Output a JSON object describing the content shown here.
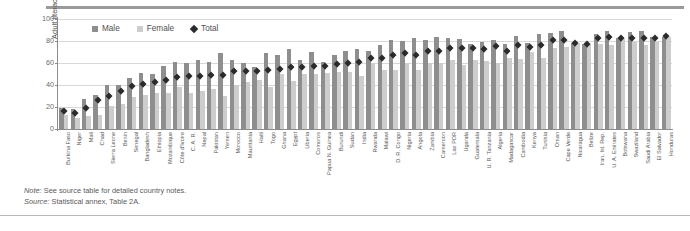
{
  "axis": {
    "ylabel": "Adult literacy rate (%)",
    "yticks": [
      "100",
      "80",
      "60",
      "40",
      "20",
      "0"
    ]
  },
  "legend": {
    "items": [
      {
        "label": "Male",
        "type": "swatch",
        "color": "#8e8e8e",
        "icon": "square-swatch"
      },
      {
        "label": "Female",
        "type": "swatch",
        "color": "#cdcdcd",
        "icon": "square-swatch"
      },
      {
        "label": "Total",
        "type": "diamond",
        "color": "#2b2b2b",
        "icon": "diamond-marker"
      }
    ]
  },
  "notes": {
    "note_key": "Note:",
    "note_text": " See source table for detailed country notes.",
    "source_key": "Source:",
    "source_text": " Statistical annex, Table 2A."
  },
  "chart_data": {
    "type": "bar",
    "title": "",
    "subtitle": "",
    "xlabel": "",
    "ylabel": "Adult literacy rate (%)",
    "ylim": [
      0,
      100
    ],
    "yticks": [
      0,
      20,
      40,
      60,
      80,
      100
    ],
    "grid": true,
    "legend_position": "top-center",
    "annotations": [
      "Note: See source table for detailed country notes.",
      "Source: Statistical annex, Table 2A."
    ],
    "marker_series": {
      "name": "Total",
      "marker": "diamond",
      "color": "#2b2b2b"
    },
    "categories": [
      "Burkina Faso",
      "Niger",
      "Mali",
      "Chad",
      "Sierra Leone",
      "Benin",
      "Senegal",
      "Bangladesh",
      "Ethiopia",
      "Mozambique",
      "Côte d'Ivoire",
      "C. A. R.",
      "Nepal",
      "Pakistan",
      "Yemen",
      "Morocco",
      "Mauritania",
      "Haiti",
      "Togo",
      "Ghana",
      "Egypt",
      "Liberia",
      "Comoros",
      "Papua N. Guinea",
      "Burundi",
      "Sudan",
      "India",
      "Rwanda",
      "Malawi",
      "D. R. Congo",
      "Nigeria",
      "Angola",
      "Zambia",
      "Cameroon",
      "Lao PDR",
      "Uganda",
      "Guatemala",
      "U. R. Tanzania",
      "Algeria",
      "Madagascar",
      "Cambodia",
      "Kenya",
      "Tunisia",
      "Oman",
      "Cape Verde",
      "Nicaragua",
      "Belize",
      "Iran, Isl. Rep.",
      "U. A. Emirates",
      "Botswana",
      "Swaziland",
      "Saudi Arabia",
      "El Salvador",
      "Honduras"
    ],
    "series": [
      {
        "name": "Male",
        "color": "#8e8e8e",
        "values": [
          19,
          18,
          27,
          31,
          40,
          40,
          46,
          51,
          50,
          57,
          61,
          60,
          63,
          61,
          69,
          63,
          60,
          56,
          69,
          67,
          73,
          63,
          70,
          61,
          67,
          71,
          73,
          71,
          76,
          81,
          80,
          83,
          81,
          84,
          83,
          82,
          77,
          79,
          81,
          77,
          85,
          78,
          86,
          87,
          89,
          78,
          77,
          86,
          89,
          83,
          88,
          89,
          84,
          84
        ]
      },
      {
        "name": "Female",
        "color": "#cdcdcd",
        "values": [
          13,
          10,
          12,
          13,
          21,
          23,
          29,
          31,
          33,
          33,
          38,
          33,
          35,
          36,
          30,
          40,
          43,
          45,
          38,
          50,
          44,
          50,
          50,
          51,
          52,
          52,
          48,
          60,
          54,
          54,
          60,
          54,
          60,
          60,
          63,
          58,
          63,
          62,
          60,
          65,
          64,
          70,
          65,
          74,
          75,
          78,
          77,
          77,
          76,
          82,
          79,
          76,
          79,
          84
        ]
      }
    ],
    "total_values": [
      16,
      14,
      19,
      26,
      30,
      34,
      39,
      41,
      42,
      44,
      47,
      48,
      48,
      49,
      49,
      52,
      52,
      52,
      53,
      54,
      56,
      56,
      57,
      57,
      59,
      60,
      61,
      64,
      64,
      67,
      69,
      67,
      71,
      71,
      73,
      73,
      73,
      72,
      75,
      71,
      76,
      74,
      76,
      81,
      81,
      78,
      77,
      82,
      83,
      82,
      82,
      82,
      82,
      84
    ]
  }
}
